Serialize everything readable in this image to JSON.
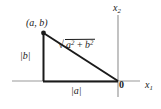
{
  "figure": {
    "axes": {
      "x_axis_label": "x",
      "x_axis_subscript": "1",
      "y_axis_label": "x",
      "y_axis_subscript": "2",
      "origin_label": "0"
    },
    "labels": {
      "vertex": "(a, b)",
      "vertical_leg": "|b|",
      "horizontal_leg": "|a|",
      "hypotenuse_base": "a",
      "hypotenuse_exp1": "2",
      "hypotenuse_plus": " + ",
      "hypotenuse_base2": "b",
      "hypotenuse_exp2": "2",
      "hypotenuse_full": "√(a² + b²)"
    },
    "colors": {
      "axis": "#9a9a9a",
      "triangle": "#1a1a1a",
      "text": "#1a1a1a",
      "background": "#ffffff"
    },
    "geometry": {
      "vertex_point": "(a, b)",
      "origin_point": "0",
      "foot_point": "(a, 0)"
    }
  }
}
